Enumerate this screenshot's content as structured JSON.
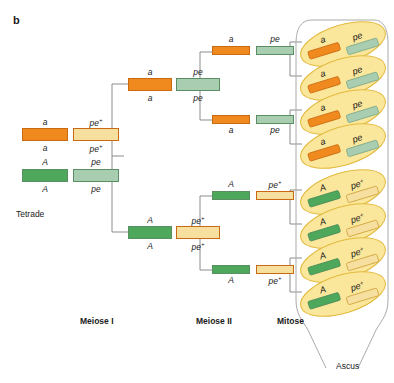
{
  "figure": {
    "panel_letter": "b",
    "ascus_label": "Ascus",
    "tetrade_label": "Tetrade"
  },
  "colors": {
    "orange": "#F08A1E",
    "pale_yellow": "#F7DFA0",
    "dark_green": "#4DA85C",
    "pale_green": "#A8CDB0",
    "spore_fill": "#FBE79B",
    "spore_stroke": "#E2B93C",
    "ascus_stroke": "#AAAAAA",
    "connector": "#808080",
    "text": "#1A1A1A"
  },
  "stages": [
    {
      "id": "meiose-1",
      "label": "Meiose I"
    },
    {
      "id": "meiose-2",
      "label": "Meiose II"
    },
    {
      "id": "mitose",
      "label": "Mitose"
    }
  ],
  "tetrade": {
    "label": "Tetrade",
    "chromatids": [
      {
        "top_label": "a",
        "bottom_label": "a",
        "color": "orange",
        "superscript": ""
      },
      {
        "top_label": "pe",
        "bottom_label": "pe",
        "color": "pale_yellow",
        "superscript": "+"
      },
      {
        "top_label": "A",
        "bottom_label": "A",
        "color": "dark_green",
        "superscript": ""
      },
      {
        "top_label": "pe",
        "bottom_label": "pe",
        "color": "pale_green",
        "superscript": ""
      }
    ]
  },
  "meiose1": [
    {
      "id": "m1-top",
      "left": {
        "label": "a",
        "sup": "",
        "color": "orange"
      },
      "right": {
        "label": "pe",
        "sup": "",
        "color": "pale_green"
      }
    },
    {
      "id": "m1-bottom",
      "left": {
        "label": "A",
        "sup": "",
        "color": "dark_green"
      },
      "right": {
        "label": "pe",
        "sup": "+",
        "color": "pale_yellow"
      }
    }
  ],
  "meiose2": [
    {
      "id": "m2-1",
      "labels_above": true,
      "left": {
        "label": "a",
        "sup": "",
        "color": "orange"
      },
      "right": {
        "label": "pe",
        "sup": "",
        "color": "pale_green"
      }
    },
    {
      "id": "m2-2",
      "labels_above": false,
      "left": {
        "label": "a",
        "sup": "",
        "color": "orange"
      },
      "right": {
        "label": "pe",
        "sup": "",
        "color": "pale_green"
      }
    },
    {
      "id": "m2-3",
      "labels_above": true,
      "left": {
        "label": "A",
        "sup": "",
        "color": "dark_green"
      },
      "right": {
        "label": "pe",
        "sup": "+",
        "color": "pale_yellow"
      }
    },
    {
      "id": "m2-4",
      "labels_above": false,
      "left": {
        "label": "A",
        "sup": "",
        "color": "dark_green"
      },
      "right": {
        "label": "pe",
        "sup": "+",
        "color": "pale_yellow"
      }
    }
  ],
  "ascospores": [
    {
      "id": "spore-1",
      "left": {
        "label": "a",
        "sup": "",
        "color": "orange"
      },
      "right": {
        "label": "pe",
        "sup": "",
        "color": "pale_green"
      }
    },
    {
      "id": "spore-2",
      "left": {
        "label": "a",
        "sup": "",
        "color": "orange"
      },
      "right": {
        "label": "pe",
        "sup": "",
        "color": "pale_green"
      }
    },
    {
      "id": "spore-3",
      "left": {
        "label": "a",
        "sup": "",
        "color": "orange"
      },
      "right": {
        "label": "pe",
        "sup": "",
        "color": "pale_green"
      }
    },
    {
      "id": "spore-4",
      "left": {
        "label": "a",
        "sup": "",
        "color": "orange"
      },
      "right": {
        "label": "pe",
        "sup": "",
        "color": "pale_green"
      }
    },
    {
      "id": "spore-5",
      "left": {
        "label": "A",
        "sup": "",
        "color": "dark_green"
      },
      "right": {
        "label": "pe",
        "sup": "+",
        "color": "pale_yellow"
      }
    },
    {
      "id": "spore-6",
      "left": {
        "label": "A",
        "sup": "",
        "color": "dark_green"
      },
      "right": {
        "label": "pe",
        "sup": "+",
        "color": "pale_yellow"
      }
    },
    {
      "id": "spore-7",
      "left": {
        "label": "A",
        "sup": "",
        "color": "dark_green"
      },
      "right": {
        "label": "pe",
        "sup": "+",
        "color": "pale_yellow"
      }
    },
    {
      "id": "spore-8",
      "left": {
        "label": "A",
        "sup": "",
        "color": "dark_green"
      },
      "right": {
        "label": "pe",
        "sup": "+",
        "color": "pale_yellow"
      }
    }
  ]
}
